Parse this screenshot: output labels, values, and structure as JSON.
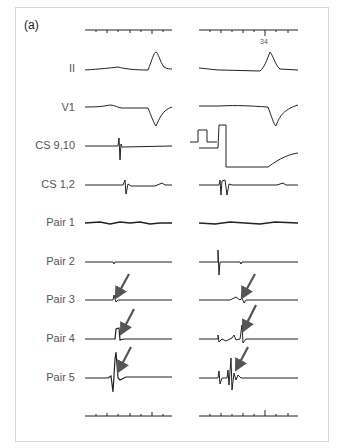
{
  "figure": {
    "panel_label": "(a)",
    "top_scale_label": "34",
    "leads": [
      {
        "label": "II",
        "y": 69
      },
      {
        "label": "V1",
        "y": 108
      },
      {
        "label": "CS 9,10",
        "y": 146
      },
      {
        "label": "CS 1,2",
        "y": 185
      },
      {
        "label": "Pair 1",
        "y": 223
      },
      {
        "label": "Pair 2",
        "y": 262
      },
      {
        "label": "Pair 3",
        "y": 300
      },
      {
        "label": "Pair 4",
        "y": 339
      },
      {
        "label": "Pair 5",
        "y": 378
      }
    ],
    "arrow_color": "#555555",
    "trace_color": "#222222"
  }
}
